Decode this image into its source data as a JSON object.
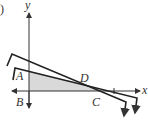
{
  "figure": {
    "part_label": ")",
    "axes": {
      "x_label": "x",
      "y_label": "y"
    },
    "points": {
      "A": "A",
      "B": "B",
      "C": "C",
      "D": "D"
    },
    "colors": {
      "line": "#222222",
      "shade": "#d9d9d9",
      "axis": "#333333"
    }
  }
}
